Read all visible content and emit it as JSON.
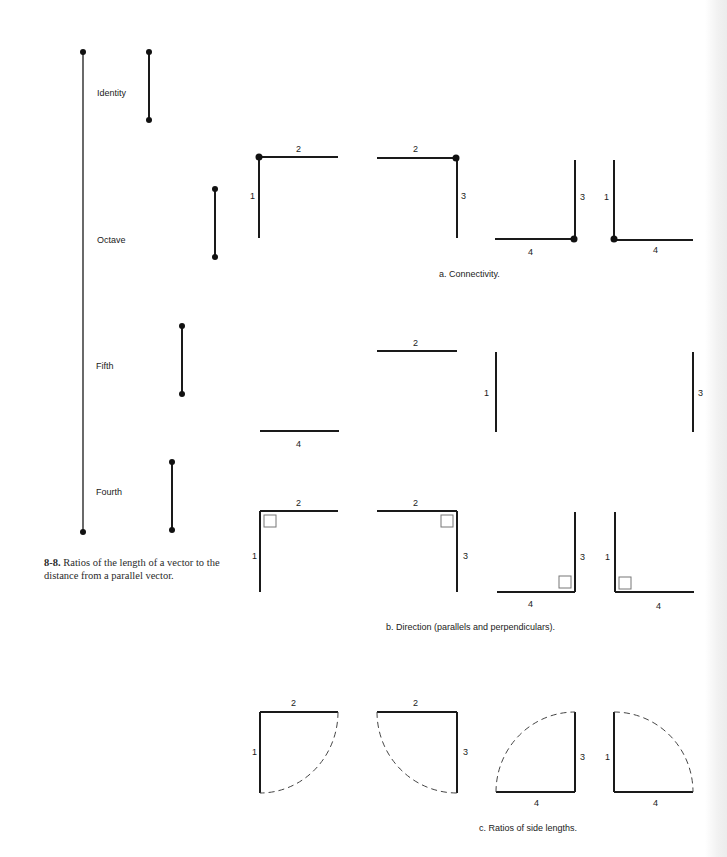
{
  "figure_8_8": {
    "caption_number": "8-8.",
    "caption_text": "Ratios of the length of a vector to the distance from a parallel vector.",
    "intervals": [
      {
        "label": "Identity"
      },
      {
        "label": "Octave"
      },
      {
        "label": "Fifth"
      },
      {
        "label": "Fourth"
      }
    ]
  },
  "panels": {
    "a": {
      "caption": "a. Connectivity."
    },
    "b": {
      "caption": "b. Direction (parallels and perpendiculars)."
    },
    "c": {
      "caption": "c. Ratios of side lengths."
    }
  },
  "side_labels": {
    "one": "1",
    "two": "2",
    "three": "3",
    "four": "4"
  }
}
